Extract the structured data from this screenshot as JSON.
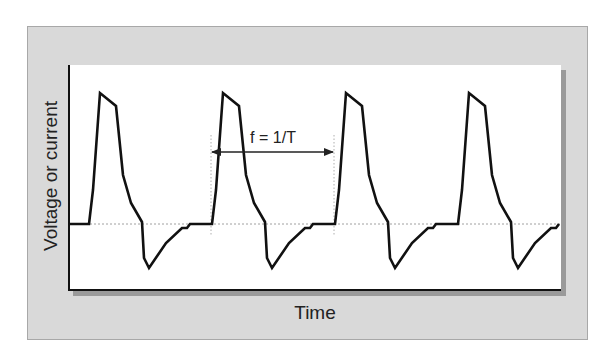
{
  "chart_data": {
    "type": "line",
    "title": "",
    "xlabel": "Time",
    "ylabel": "Voltage or current",
    "grid": false,
    "legend": null,
    "baseline_dashed": true,
    "annotations": [
      {
        "text": "f = 1/T",
        "type": "double-arrow",
        "spans": "one period, between dotted vertical markers"
      }
    ],
    "cycles": 4,
    "series": [
      {
        "name": "waveform",
        "color": "#111111",
        "points_px": [
          [
            69,
            224
          ],
          [
            89,
            224
          ],
          [
            93,
            190
          ],
          [
            100,
            93
          ],
          [
            116,
            106
          ],
          [
            123,
            175
          ],
          [
            131,
            203
          ],
          [
            142,
            222
          ],
          [
            144,
            258
          ],
          [
            149,
            268
          ],
          [
            166,
            243
          ],
          [
            182,
            228
          ],
          [
            187,
            228
          ],
          [
            190,
            224
          ],
          [
            212,
            224
          ],
          [
            216,
            190
          ],
          [
            223,
            93
          ],
          [
            239,
            106
          ],
          [
            246,
            175
          ],
          [
            254,
            203
          ],
          [
            265,
            222
          ],
          [
            267,
            258
          ],
          [
            272,
            268
          ],
          [
            289,
            243
          ],
          [
            305,
            228
          ],
          [
            310,
            228
          ],
          [
            313,
            224
          ],
          [
            335,
            224
          ],
          [
            339,
            190
          ],
          [
            346,
            93
          ],
          [
            362,
            106
          ],
          [
            369,
            175
          ],
          [
            377,
            203
          ],
          [
            388,
            222
          ],
          [
            390,
            258
          ],
          [
            395,
            268
          ],
          [
            412,
            243
          ],
          [
            428,
            228
          ],
          [
            433,
            228
          ],
          [
            436,
            224
          ],
          [
            458,
            224
          ],
          [
            462,
            190
          ],
          [
            469,
            93
          ],
          [
            485,
            106
          ],
          [
            492,
            175
          ],
          [
            500,
            203
          ],
          [
            511,
            222
          ],
          [
            513,
            258
          ],
          [
            518,
            268
          ],
          [
            535,
            243
          ],
          [
            551,
            228
          ],
          [
            556,
            228
          ],
          [
            559,
            224
          ]
        ]
      }
    ],
    "relative_values": {
      "baseline": 0,
      "peak": 1.0,
      "trough": -0.34,
      "period_px": 123
    }
  },
  "labels": {
    "ylabel": "Voltage or current",
    "xlabel": "Time",
    "annotation": "f = 1/T"
  },
  "colors": {
    "panel": "#d9d9d9",
    "plot_bg": "#ffffff",
    "line": "#111111",
    "shadow": "#9a9a9a"
  }
}
